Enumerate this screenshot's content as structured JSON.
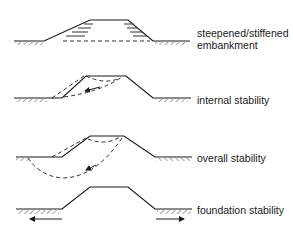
{
  "figure": {
    "panels": [
      {
        "id": "steepened",
        "label_lines": [
          "steepened/stiffened",
          "embankment"
        ]
      },
      {
        "id": "internal",
        "label_lines": [
          "internal stability"
        ]
      },
      {
        "id": "overall",
        "label_lines": [
          "overall stability"
        ]
      },
      {
        "id": "foundation",
        "label_lines": [
          "foundation stability"
        ]
      }
    ],
    "colors": {
      "line": "#1a1a1a",
      "background": "#ffffff"
    }
  }
}
